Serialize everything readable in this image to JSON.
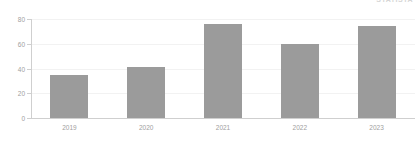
{
  "watermark": {
    "text": "STATISTA"
  },
  "chart_data": {
    "type": "bar",
    "title": "",
    "subtitle": "",
    "xlabel": "",
    "ylabel": "",
    "categories": [
      "2019",
      "2020",
      "2021",
      "2022",
      "2023"
    ],
    "values": [
      35,
      41,
      76,
      60,
      74
    ],
    "series": [
      {
        "name": "Value",
        "values": [
          35,
          41,
          76,
          60,
          74
        ],
        "color": "#9b9b9b"
      }
    ],
    "ylim": [
      0,
      80
    ],
    "ytick_labels": [
      "0",
      "20",
      "40",
      "60",
      "80"
    ],
    "ytick_values": [
      0,
      20,
      40,
      60,
      80
    ],
    "grid": true,
    "grid_color": "#f2f2f2",
    "axis_color": "#cfcfcf",
    "tick_label_color": "#a0a0a0",
    "legend": "none",
    "legend_position": "none",
    "bar_color": "#9b9b9b",
    "background": "#ffffff"
  }
}
